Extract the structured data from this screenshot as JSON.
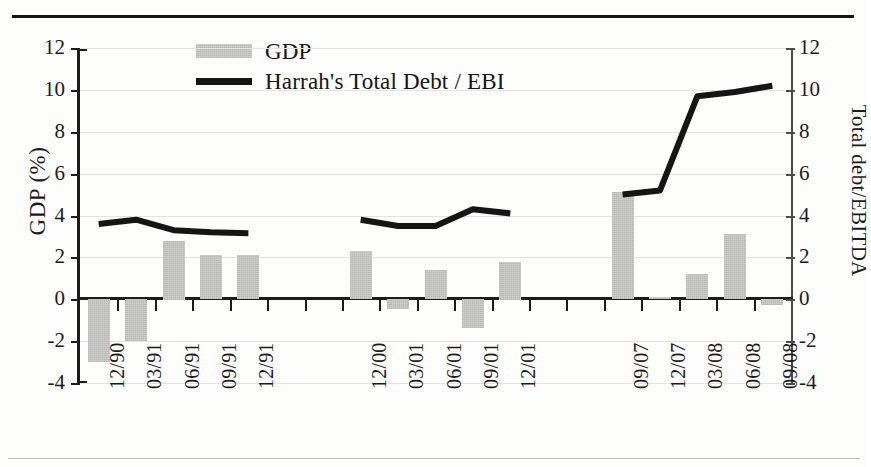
{
  "figure": {
    "has_top_rule": true,
    "has_bottom_rule": true,
    "background_color": "#fdfdfc"
  },
  "legend": {
    "position": "top-center",
    "items": [
      {
        "marker": "bar-swatch",
        "label": "GDP",
        "color": "#c9c9c7"
      },
      {
        "marker": "line-swatch",
        "label": "Harrah's Total Debt / EBI",
        "color": "#151515"
      }
    ]
  },
  "axes": {
    "left": {
      "title": "GDP (%)",
      "ticks": [
        "12",
        "10",
        "8",
        "6",
        "4",
        "2",
        "0",
        "-2",
        "-4"
      ],
      "min": -4,
      "max": 12,
      "step": 2
    },
    "right": {
      "title": "Total debt/EBITDA",
      "ticks": [
        "12",
        "10",
        "8",
        "6",
        "4",
        "2",
        "0",
        "-2",
        "-4"
      ],
      "min": -4,
      "max": 12,
      "step": 2
    }
  },
  "chart_data": {
    "type": "bar",
    "title": "",
    "xlabel": "",
    "ylabel": "GDP (%)",
    "y2label": "Total debt/EBITDA",
    "ylim": [
      -4,
      12
    ],
    "y2lim": [
      -4,
      12
    ],
    "grid": true,
    "legend_position": "top-center",
    "categories": [
      "12/90",
      "03/91",
      "06/91",
      "09/91",
      "12/91",
      "",
      "",
      "12/00",
      "03/01",
      "06/01",
      "09/01",
      "12/01",
      "",
      "",
      "09/07",
      "12/07",
      "03/08",
      "06/08",
      "09/08"
    ],
    "series": [
      {
        "name": "GDP",
        "type": "bar",
        "axis": "left",
        "color": "#c9c9c7",
        "values": [
          -3.0,
          -2.0,
          2.8,
          2.1,
          2.1,
          null,
          null,
          2.3,
          -0.5,
          1.4,
          -1.4,
          1.8,
          null,
          null,
          5.1,
          0.1,
          1.2,
          3.1,
          -0.3
        ]
      },
      {
        "name": "Harrah's Total Debt / EBI",
        "type": "line",
        "axis": "right",
        "color": "#151515",
        "values": [
          3.6,
          3.8,
          3.3,
          3.2,
          3.15,
          null,
          null,
          3.8,
          3.5,
          3.5,
          4.3,
          4.1,
          null,
          null,
          5.0,
          5.2,
          9.7,
          9.9,
          10.2
        ]
      }
    ]
  }
}
